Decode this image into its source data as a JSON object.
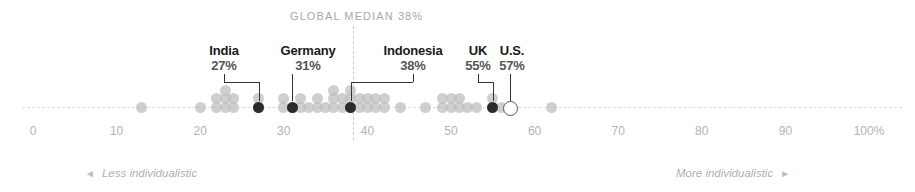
{
  "chart_data": {
    "type": "scatter",
    "title": "GLOBAL MEDIAN 38%",
    "xlabel": "",
    "ylabel": "",
    "xlim": [
      0,
      100
    ],
    "grid": false,
    "legend_position": "none",
    "median_value": 38,
    "median_label": "GLOBAL MEDIAN 38%",
    "axis_unit_suffix": "%",
    "ticks": [
      {
        "value": 0,
        "label": "0"
      },
      {
        "value": 10,
        "label": "10"
      },
      {
        "value": 20,
        "label": "20"
      },
      {
        "value": 30,
        "label": "30"
      },
      {
        "value": 40,
        "label": "40"
      },
      {
        "value": 50,
        "label": "50"
      },
      {
        "value": 60,
        "label": "60"
      },
      {
        "value": 70,
        "label": "70"
      },
      {
        "value": 80,
        "label": "80"
      },
      {
        "value": 90,
        "label": "90"
      },
      {
        "value": 100,
        "label": "100%"
      }
    ],
    "annotations": {
      "left_axis_note": "Less individualistic",
      "right_axis_note": "More individualistic",
      "left_arrow": "◄",
      "right_arrow": "►"
    },
    "highlighted_points": [
      {
        "country": "India",
        "name": "India",
        "value": 27,
        "value_label": "27%",
        "marker": "filled"
      },
      {
        "country": "Germany",
        "name": "Germany",
        "value": 31,
        "value_label": "31%",
        "marker": "filled"
      },
      {
        "country": "Indonesia",
        "name": "Indonesia",
        "value": 38,
        "value_label": "38%",
        "marker": "filled"
      },
      {
        "country": "UK",
        "name": "UK",
        "value": 55,
        "value_label": "55%",
        "marker": "filled"
      },
      {
        "country": "U.S.",
        "name": "U.S.",
        "value": 57,
        "value_label": "57%",
        "marker": "open"
      }
    ],
    "points": [
      {
        "value": 13,
        "stack": 1
      },
      {
        "value": 20,
        "stack": 1
      },
      {
        "value": 22,
        "stack": 1
      },
      {
        "value": 22,
        "stack": 2
      },
      {
        "value": 23,
        "stack": 1
      },
      {
        "value": 23,
        "stack": 2
      },
      {
        "value": 23,
        "stack": 3
      },
      {
        "value": 24,
        "stack": 1
      },
      {
        "value": 24,
        "stack": 2
      },
      {
        "value": 27,
        "stack": 1
      },
      {
        "value": 27,
        "stack": 2
      },
      {
        "value": 30,
        "stack": 1
      },
      {
        "value": 30,
        "stack": 2
      },
      {
        "value": 31,
        "stack": 1
      },
      {
        "value": 32,
        "stack": 1
      },
      {
        "value": 32,
        "stack": 2
      },
      {
        "value": 33,
        "stack": 1
      },
      {
        "value": 34,
        "stack": 1
      },
      {
        "value": 34,
        "stack": 2
      },
      {
        "value": 35,
        "stack": 1
      },
      {
        "value": 36,
        "stack": 1
      },
      {
        "value": 36,
        "stack": 2
      },
      {
        "value": 36,
        "stack": 3
      },
      {
        "value": 37,
        "stack": 1
      },
      {
        "value": 37,
        "stack": 2
      },
      {
        "value": 38,
        "stack": 2
      },
      {
        "value": 38,
        "stack": 3
      },
      {
        "value": 39,
        "stack": 1
      },
      {
        "value": 39,
        "stack": 2
      },
      {
        "value": 40,
        "stack": 1
      },
      {
        "value": 40,
        "stack": 2
      },
      {
        "value": 41,
        "stack": 1
      },
      {
        "value": 41,
        "stack": 2
      },
      {
        "value": 42,
        "stack": 1
      },
      {
        "value": 42,
        "stack": 2
      },
      {
        "value": 44,
        "stack": 1
      },
      {
        "value": 47,
        "stack": 1
      },
      {
        "value": 49,
        "stack": 1
      },
      {
        "value": 49,
        "stack": 2
      },
      {
        "value": 50,
        "stack": 1
      },
      {
        "value": 50,
        "stack": 2
      },
      {
        "value": 51,
        "stack": 1
      },
      {
        "value": 51,
        "stack": 2
      },
      {
        "value": 52,
        "stack": 1
      },
      {
        "value": 53,
        "stack": 1
      },
      {
        "value": 55,
        "stack": 2
      },
      {
        "value": 56,
        "stack": 1
      },
      {
        "value": 62,
        "stack": 1
      }
    ]
  }
}
